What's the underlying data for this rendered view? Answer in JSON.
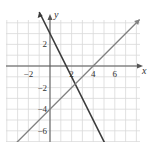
{
  "chart_data": {
    "type": "line",
    "title": "",
    "xlabel": "x",
    "ylabel": "y",
    "xlim": [
      -4,
      8
    ],
    "ylim": [
      -7,
      5
    ],
    "grid": true,
    "x_ticks": [
      -2,
      2,
      4,
      6
    ],
    "y_ticks": [
      2,
      -2,
      -4,
      -6
    ],
    "x_tick_labels": [
      "−2",
      "2",
      "4",
      "6"
    ],
    "y_tick_labels": [
      "2",
      "−2",
      "−4",
      "−6"
    ],
    "series": [
      {
        "name": "line-1",
        "equation": "y = -2x + 3",
        "slope": -2,
        "intercept": 3,
        "color": "#3a3a3a",
        "x": [
          -1,
          0,
          1.5,
          2,
          5
        ],
        "y": [
          5,
          3,
          0,
          -1,
          -7
        ]
      },
      {
        "name": "line-2",
        "equation": "y = x - 4",
        "slope": 1,
        "intercept": -4,
        "color": "#777777",
        "x": [
          -3,
          0,
          4,
          8
        ],
        "y": [
          -7,
          -4,
          0,
          4
        ]
      }
    ],
    "intersection": {
      "x": 2.33,
      "y": -1.67
    },
    "legend": "none"
  },
  "colors": {
    "grid": "#d9d9d9",
    "axis": "#555555",
    "line1": "#3a3a3a",
    "line2": "#808080",
    "background": "#ffffff"
  },
  "labels": {
    "x_axis": "x",
    "y_axis": "y",
    "x_ticks": [
      "−2",
      "2",
      "4",
      "6"
    ],
    "y_ticks": [
      "2",
      "−2",
      "−4",
      "−6"
    ]
  }
}
